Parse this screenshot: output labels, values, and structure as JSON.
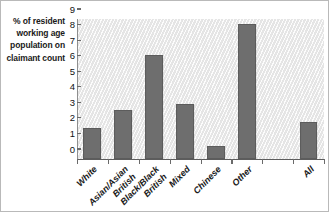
{
  "axis": {
    "y_caption_lines": [
      "% of resident",
      "working age",
      "population on",
      "claimant count"
    ],
    "y_ticks": [
      "0",
      "1",
      "2",
      "3",
      "4",
      "5",
      "6",
      "7",
      "8",
      "9"
    ]
  },
  "colors": {
    "bar_fill": "#6e6e6e",
    "bar_stroke": "#5c5c5c",
    "plot_background": "#ededed",
    "axis_line": "#5d5d5d",
    "text": "#1a1a1a"
  },
  "chart_data": {
    "type": "bar",
    "title": "",
    "xlabel": "",
    "ylabel": "% of resident working age population on claimant count",
    "ylim": [
      0,
      9
    ],
    "ytick_step": 1,
    "grid": false,
    "legend": "none",
    "categories": [
      "White",
      "Asian/Asian British",
      "Black/Black British",
      "Mixed",
      "Chinese",
      "Other",
      "",
      "All"
    ],
    "category_lines": [
      [
        "White"
      ],
      [
        "Asian/Asian",
        "British"
      ],
      [
        "Black/Black",
        "British"
      ],
      [
        "Mixed"
      ],
      [
        "Chinese"
      ],
      [
        "Other"
      ],
      [],
      [
        "All"
      ]
    ],
    "values": [
      2.0,
      3.15,
      6.7,
      3.55,
      0.85,
      8.65,
      null,
      2.35
    ]
  }
}
